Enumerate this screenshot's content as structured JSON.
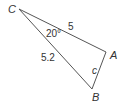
{
  "diagram": {
    "type": "triangle",
    "vertices": {
      "C": {
        "label": "C",
        "x": 19,
        "y": 9
      },
      "A": {
        "label": "A",
        "x": 106,
        "y": 52
      },
      "B": {
        "label": "B",
        "x": 92,
        "y": 89
      }
    },
    "sides": {
      "CA": {
        "label": "5"
      },
      "CB": {
        "label": "5.2"
      },
      "AB": {
        "label": "c"
      }
    },
    "angle_C": {
      "label": "20°"
    },
    "stroke_color": "#555555",
    "text_color": "#333333"
  }
}
